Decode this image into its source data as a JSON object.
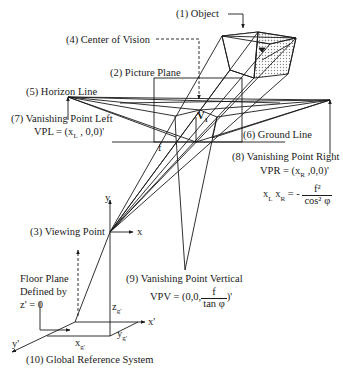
{
  "labels": {
    "object": "(1) Object",
    "picture_plane": "(2) Picture Plane",
    "viewing_point": "(3) Viewing Point",
    "center_of_vision": "(4) Center of Vision",
    "horizon_line": "(5) Horizon Line",
    "ground_line": "(6) Ground Line",
    "vpl_title": "(7) Vanishing Point Left",
    "vpl_eq_prefix": "VPL = (x",
    "vpl_eq_sub": "L",
    "vpl_eq_suffix": " , 0,0)'",
    "vpr_title": "(8) Vanishing Point Right",
    "vpr_eq_prefix": "VPR = (x",
    "vpr_eq_sub": "R",
    "vpr_eq_suffix": " ,0,0)'",
    "vpv_title": "(9) Vanishing Point Vertical",
    "vpv_eq_prefix": "VPV = (0,0,",
    "vpv_eq_num": "f",
    "vpv_eq_den": "tan φ",
    "vpv_eq_suffix": ")'",
    "grs": "(10) Global Reference System",
    "floor_line1": "Floor Plane",
    "floor_line2": "Defined by",
    "floor_line3": "z' = 0",
    "relation_lhs_x1": "x",
    "relation_lhs_sub1": "L",
    "relation_lhs_x2": " x",
    "relation_lhs_sub2": "R",
    "relation_eq": " = -",
    "relation_num": "f²",
    "relation_den": "cos² φ",
    "v1": "V",
    "v1_sub": "1",
    "v0": "V",
    "v0_sub": "o",
    "f_label": "f",
    "axis_x": "x",
    "axis_y": "y",
    "axis_xp": "x'",
    "axis_yp": "y'",
    "zg": "z",
    "zg_sub": "g'",
    "xg": "x",
    "xg_sub": "g'",
    "yg": "y",
    "yg_sub": "g'"
  },
  "colors": {
    "ink": "#1a1a1a",
    "background": "#ffffff",
    "stipple": "#9a9a9a"
  }
}
